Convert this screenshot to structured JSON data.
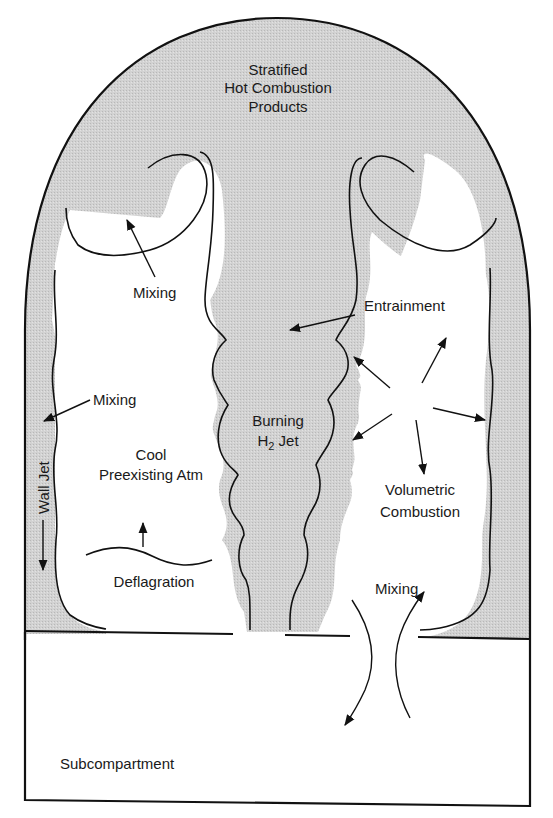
{
  "colors": {
    "hot_gas_fill": "#cfcfcf",
    "outline": "#111111",
    "background": "#ffffff"
  },
  "labels": {
    "stratified_line1": "Stratified",
    "stratified_line2": "Hot Combustion",
    "stratified_line3": "Products",
    "mixing_upper_left": "Mixing",
    "entrainment": "Entrainment",
    "mixing_wall": "Mixing",
    "burning_line1": "Burning",
    "burning_line2_main": "H",
    "burning_line2_sub": "2",
    "burning_line2_rest": " Jet",
    "cool_line1": "Cool",
    "cool_line2": "Preexisting Atm",
    "wall_jet": "Wall Jet",
    "volumetric_line1": "Volumetric",
    "volumetric_line2": "Combustion",
    "deflagration": "Deflagration",
    "mixing_vent": "Mixing",
    "subcompartment": "Subcompartment"
  }
}
